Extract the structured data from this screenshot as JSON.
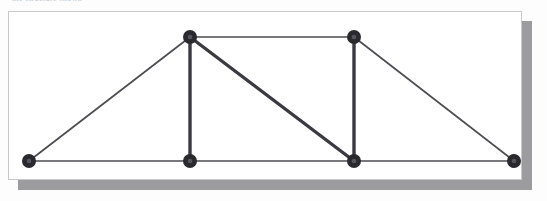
{
  "figure": {
    "caption_fragment": "the structure shown",
    "frame": {
      "border_color": "#c9c9cd",
      "background": "#ffffff",
      "shadow_color": "#9c9c9e"
    },
    "page_background": "#fdfdfd"
  },
  "chart_data": {
    "type": "diagram",
    "title": "",
    "subtitle": "",
    "xlabel": "",
    "ylabel": "",
    "grid": false,
    "legend": "none",
    "colors": {
      "member_normal": "#4c4c52",
      "member_highlight": "#3a3a40",
      "joint_fill": "#2a2a2e",
      "joint_highlight": "#55555c"
    },
    "nodes": [
      {
        "id": "A",
        "label": "",
        "x": 29,
        "y": 161,
        "role": "support-left"
      },
      {
        "id": "B",
        "label": "",
        "x": 190,
        "y": 161,
        "role": "bottom-chord"
      },
      {
        "id": "C",
        "label": "",
        "x": 354,
        "y": 161,
        "role": "bottom-chord"
      },
      {
        "id": "D",
        "label": "",
        "x": 514,
        "y": 161,
        "role": "support-right"
      },
      {
        "id": "E",
        "label": "",
        "x": 190,
        "y": 37,
        "role": "top-chord"
      },
      {
        "id": "F",
        "label": "",
        "x": 354,
        "y": 37,
        "role": "top-chord"
      }
    ],
    "node_radius": 7,
    "members": [
      {
        "id": "m1",
        "from": "A",
        "to": "B",
        "kind": "bottom-chord",
        "weight": "thin"
      },
      {
        "id": "m2",
        "from": "B",
        "to": "C",
        "kind": "bottom-chord",
        "weight": "thin"
      },
      {
        "id": "m3",
        "from": "C",
        "to": "D",
        "kind": "bottom-chord",
        "weight": "thin"
      },
      {
        "id": "m4",
        "from": "E",
        "to": "F",
        "kind": "top-chord",
        "weight": "thin"
      },
      {
        "id": "m5",
        "from": "A",
        "to": "E",
        "kind": "end-diagonal",
        "weight": "thin"
      },
      {
        "id": "m6",
        "from": "F",
        "to": "D",
        "kind": "end-diagonal",
        "weight": "thin"
      },
      {
        "id": "m7",
        "from": "E",
        "to": "B",
        "kind": "vertical",
        "weight": "thick"
      },
      {
        "id": "m8",
        "from": "F",
        "to": "C",
        "kind": "vertical",
        "weight": "thick"
      },
      {
        "id": "m9",
        "from": "E",
        "to": "C",
        "kind": "diagonal",
        "weight": "thick"
      }
    ]
  }
}
